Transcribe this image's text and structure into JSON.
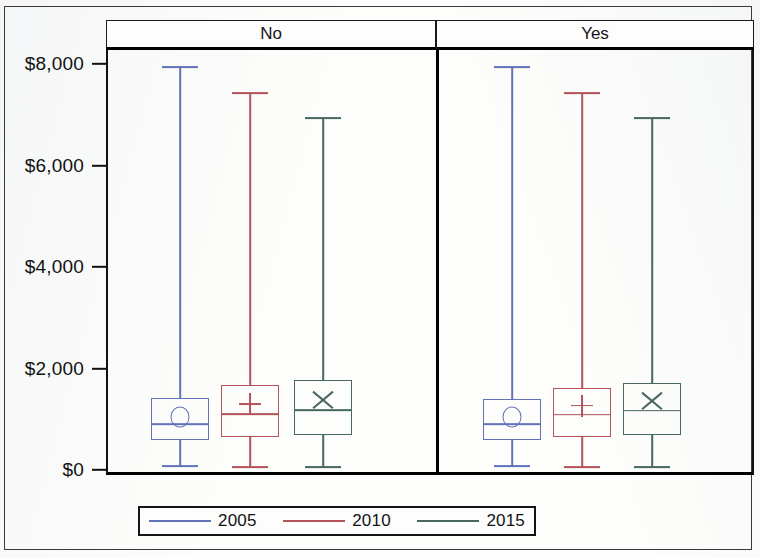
{
  "figure": {
    "background_color": "#fdfdfb",
    "frame_color": "#3a3a3a"
  },
  "panels": [
    {
      "id": "no",
      "label": "No"
    },
    {
      "id": "yes",
      "label": "Yes"
    }
  ],
  "y_axis": {
    "tick_labels": [
      "$8,000",
      "$6,000",
      "$4,000",
      "$2,000",
      "$0"
    ],
    "tick_values": [
      8000,
      6000,
      4000,
      2000,
      0
    ],
    "min": 0,
    "max": 8250
  },
  "legend": {
    "entries": [
      {
        "label": "2005",
        "color": "#6272b8"
      },
      {
        "label": "2010",
        "color": "#b4535a"
      },
      {
        "label": "2015",
        "color": "#46685f"
      }
    ]
  },
  "series_colors": {
    "2005": "#6272b8",
    "2010": "#b4535a",
    "2015": "#46685f"
  },
  "mean_markers": {
    "2005": "circle",
    "2010": "plus",
    "2015": "cross"
  },
  "chart_data": {
    "type": "box",
    "title": "",
    "xlabel": "",
    "ylabel": "",
    "ylim": [
      0,
      8250
    ],
    "ytick_labels": [
      "$0",
      "$2,000",
      "$4,000",
      "$6,000",
      "$8,000"
    ],
    "ytick_values": [
      0,
      2000,
      4000,
      6000,
      8000
    ],
    "grid": false,
    "legend_position": "bottom",
    "panel_variable": "No / Yes",
    "panels": [
      "No",
      "Yes"
    ],
    "legend": [
      "2005",
      "2010",
      "2015"
    ],
    "boxes": [
      {
        "panel": "No",
        "series": "2005",
        "color": "#6272b8",
        "mean_marker": "circle",
        "whisker_low": 80,
        "q1": 590,
        "median": 910,
        "q3": 1420,
        "whisker_high": 7940,
        "mean": 1045
      },
      {
        "panel": "No",
        "series": "2010",
        "color": "#b4535a",
        "mean_marker": "plus",
        "whisker_low": 60,
        "q1": 650,
        "median": 1105,
        "q3": 1675,
        "whisker_high": 7430,
        "mean": 1300
      },
      {
        "panel": "No",
        "series": "2015",
        "color": "#46685f",
        "mean_marker": "cross",
        "whisker_low": 60,
        "q1": 690,
        "median": 1180,
        "q3": 1775,
        "whisker_high": 6930,
        "mean": 1380
      },
      {
        "panel": "Yes",
        "series": "2005",
        "color": "#6272b8",
        "mean_marker": "circle",
        "whisker_low": 80,
        "q1": 590,
        "median": 910,
        "q3": 1400,
        "whisker_high": 7940,
        "mean": 1045
      },
      {
        "panel": "Yes",
        "series": "2010",
        "color": "#b4535a",
        "mean_marker": "plus",
        "whisker_low": 60,
        "q1": 660,
        "median": 1090,
        "q3": 1620,
        "whisker_high": 7430,
        "mean": 1270
      },
      {
        "panel": "Yes",
        "series": "2015",
        "color": "#46685f",
        "mean_marker": "cross",
        "whisker_low": 60,
        "q1": 690,
        "median": 1170,
        "q3": 1720,
        "whisker_high": 6930,
        "mean": 1360
      }
    ]
  },
  "geometry": {
    "y_pixel_at_zero": 470,
    "y_pixel_at_8000": 64,
    "box_width": 58,
    "cap_width": 36,
    "box_centers": [
      180,
      250,
      323,
      512,
      582,
      652
    ]
  }
}
